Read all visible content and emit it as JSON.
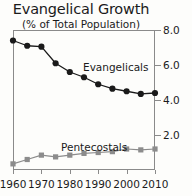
{
  "chart_data": {
    "type": "line",
    "title": "Evangelical Growth",
    "subtitle": "(% of Total Population)",
    "xlabel": "",
    "ylabel": "",
    "xlim": [
      1960,
      2010
    ],
    "ylim": [
      0.0,
      8.0
    ],
    "grid": false,
    "legend_position": "inline-annotation",
    "y_axis_side": "right",
    "x": [
      1960,
      1965,
      1970,
      1975,
      1980,
      1985,
      1990,
      1995,
      2000,
      2005,
      2010
    ],
    "xticks": [
      1960,
      1970,
      1980,
      1990,
      2000,
      2010
    ],
    "xtick_labels": [
      "1960",
      "1970",
      "1980",
      "1990",
      "2000",
      "2010"
    ],
    "yticks": [
      2.0,
      4.0,
      6.0,
      8.0
    ],
    "ytick_labels": [
      "2.0",
      "4.0",
      "6.0",
      "8.0"
    ],
    "series": [
      {
        "name": "Evangelicals",
        "marker": "circle",
        "color": "#1a1a1a",
        "values": [
          7.4,
          7.1,
          7.05,
          6.1,
          5.6,
          5.3,
          4.9,
          4.65,
          4.5,
          4.35,
          4.4
        ]
      },
      {
        "name": "Pentecostals",
        "marker": "square",
        "color": "#8c8c8c",
        "values": [
          0.35,
          0.6,
          0.85,
          0.75,
          0.85,
          0.95,
          1.0,
          1.05,
          1.2,
          1.15,
          1.2
        ]
      }
    ],
    "annotations": [
      {
        "text": "Evangelicals",
        "series": "Evangelicals"
      },
      {
        "text": "Pentecostals",
        "series": "Pentecostals"
      }
    ]
  }
}
